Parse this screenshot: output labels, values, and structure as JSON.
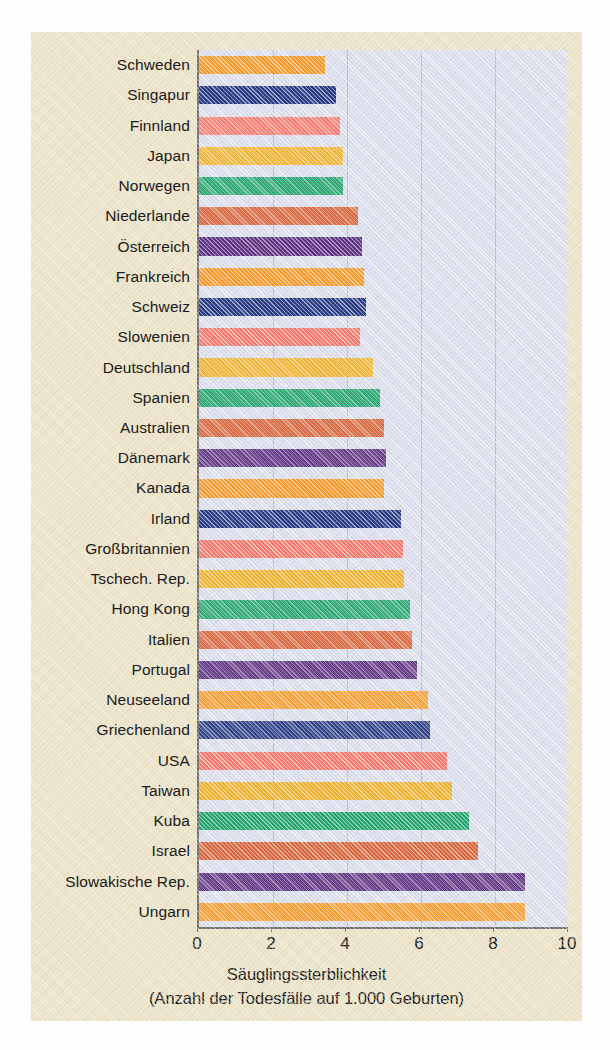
{
  "chart_data": {
    "type": "bar",
    "orientation": "horizontal",
    "title": "",
    "xlabel_line1": "Säuglingssterblichkeit",
    "xlabel_line2": "(Anzahl der Todesfälle auf 1.000 Geburten)",
    "ylabel": "",
    "xlim": [
      0,
      10
    ],
    "xticks": [
      0,
      2,
      4,
      6,
      8,
      10
    ],
    "xtick_labels": [
      "0",
      "2",
      "4",
      "6",
      "8",
      "10"
    ],
    "grid": true,
    "grid_axis": "x",
    "legend": "none",
    "categories": [
      "Schweden",
      "Singapur",
      "Finnland",
      "Japan",
      "Norwegen",
      "Niederlande",
      "Österreich",
      "Frankreich",
      "Schweiz",
      "Slowenien",
      "Deutschland",
      "Spanien",
      "Australien",
      "Dänemark",
      "Kanada",
      "Irland",
      "Großbritannien",
      "Tschech. Rep.",
      "Hong Kong",
      "Italien",
      "Portugal",
      "Neuseeland",
      "Griechenland",
      "USA",
      "Taiwan",
      "Kuba",
      "Israel",
      "Slowakische Rep.",
      "Ungarn"
    ],
    "values": [
      3.4,
      3.7,
      3.8,
      3.9,
      3.9,
      4.3,
      4.4,
      4.45,
      4.5,
      4.35,
      4.7,
      4.9,
      5.0,
      5.05,
      5.0,
      5.45,
      5.5,
      5.55,
      5.7,
      5.75,
      5.9,
      6.2,
      6.25,
      6.7,
      6.85,
      7.3,
      7.55,
      8.8,
      8.8
    ],
    "bar_colors": [
      "#f49a2c",
      "#2b3d85",
      "#f47a6d",
      "#edb12f",
      "#21a16b",
      "#d6633a",
      "#5c3081",
      "#f49a2c",
      "#2b3d85",
      "#f47a6d",
      "#edb12f",
      "#21a16b",
      "#d6633a",
      "#5c3081",
      "#f49a2c",
      "#2b3d85",
      "#f47a6d",
      "#edb12f",
      "#21a16b",
      "#d6633a",
      "#5c3081",
      "#f49a2c",
      "#2b3d85",
      "#f47a6d",
      "#edb12f",
      "#21a16b",
      "#d6633a",
      "#5c3081",
      "#f49a2c"
    ]
  },
  "style": {
    "page_background": "#fdfdfb",
    "card_background": "#ece3c9",
    "plot_background": "#d7dbec",
    "gridline_color": "#b6bad0",
    "axis_color": "#6c6c6c",
    "text_color": "#1a1a1a"
  }
}
